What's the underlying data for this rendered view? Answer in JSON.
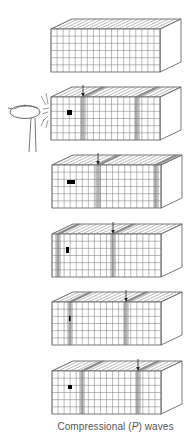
{
  "figure": {
    "caption": {
      "prefix": "Compressional (",
      "italic": "P",
      "suffix": ") waves"
    },
    "colors": {
      "line": "#555555",
      "grid": "#777777",
      "marker": "#000000",
      "caption": "#555555"
    },
    "geometry": {
      "front_width": 109,
      "front_height": 43,
      "depth_dx": 21,
      "depth_dy": -10,
      "columns": 18,
      "rows": 6
    },
    "hammer": {
      "label": "hammer striking block",
      "block_index": 1
    },
    "blocks": [
      {
        "id": "block-1",
        "x": 51,
        "y": 29,
        "arrow_x": null,
        "marker": null,
        "compressions": []
      },
      {
        "id": "block-2",
        "x": 51,
        "y": 97,
        "arrow_x": 83,
        "marker": {
          "x": 67,
          "y": 110,
          "w": 5,
          "h": 5
        },
        "compressions": [
          83,
          137
        ]
      },
      {
        "id": "block-3",
        "x": 52,
        "y": 165,
        "arrow_x": 98,
        "marker": {
          "x": 67,
          "y": 180,
          "w": 8,
          "h": 4
        },
        "compressions": [
          98,
          156
        ]
      },
      {
        "id": "block-4",
        "x": 52,
        "y": 234,
        "arrow_x": 113,
        "marker": {
          "x": 66,
          "y": 247,
          "w": 3,
          "h": 6
        },
        "compressions": [
          58,
          113
        ]
      },
      {
        "id": "block-5",
        "x": 52,
        "y": 302,
        "arrow_x": 126,
        "marker": {
          "x": 69,
          "y": 316,
          "w": 1.5,
          "h": 5
        },
        "compressions": [
          70,
          126
        ]
      },
      {
        "id": "block-6",
        "x": 52,
        "y": 371,
        "arrow_x": 138,
        "marker": {
          "x": 68,
          "y": 385,
          "w": 4,
          "h": 4
        },
        "compressions": [
          82,
          138
        ]
      }
    ]
  }
}
